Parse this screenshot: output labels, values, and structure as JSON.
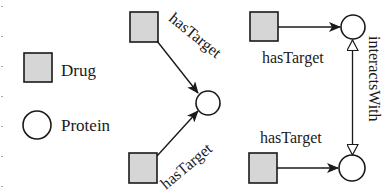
{
  "legend": {
    "items": [
      {
        "shape": "square",
        "label": "Drug"
      },
      {
        "shape": "circle",
        "label": "Protein"
      }
    ]
  },
  "colors": {
    "drug_fill": "#d6d6d6",
    "stroke": "#1a1a1a",
    "protein_fill": "#ffffff",
    "background": "#ffffff"
  },
  "pattern_left": {
    "edges": [
      {
        "from": "Drug",
        "to": "Protein",
        "label": "hasTarget"
      },
      {
        "from": "Drug",
        "to": "Protein",
        "label": "hasTarget"
      }
    ]
  },
  "pattern_right": {
    "edges": [
      {
        "from": "Drug",
        "to": "Protein",
        "label": "hasTarget"
      },
      {
        "from": "Drug",
        "to": "Protein",
        "label": "hasTarget"
      },
      {
        "from": "Protein",
        "to": "Protein",
        "label": "interactsWith",
        "bidirectional": true
      }
    ]
  }
}
